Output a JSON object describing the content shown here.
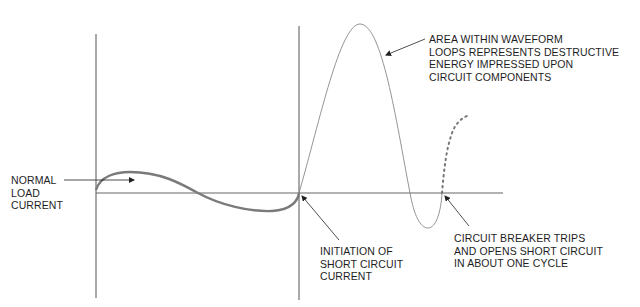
{
  "colors": {
    "axis": "#555555",
    "normal_wave": "#7a7a7a",
    "fault_wave": "#8a8a8a",
    "text": "#1e1e1e",
    "background": "#ffffff"
  },
  "labels": {
    "normal_load": "NORMAL\nLOAD\nCURRENT",
    "area_within": "AREA WITHIN WAVEFORM\nLOOPS REPRESENTS DESTRUCTIVE\nENERGY IMPRESSED UPON\nCIRCUIT COMPONENTS",
    "initiation": "INITIATION OF\nSHORT CIRCUIT\nCURRENT",
    "breaker_trips": "CIRCUIT BREAKER TRIPS\nAND OPENS SHORT CIRCUIT\nIN ABOUT ONE CYCLE"
  }
}
